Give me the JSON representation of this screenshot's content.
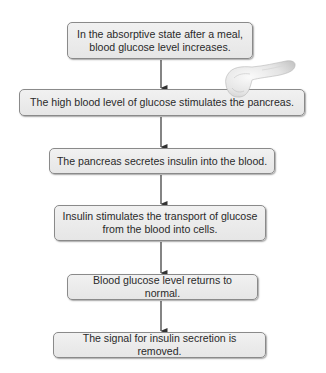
{
  "diagram": {
    "title": "",
    "type": "flowchart",
    "direction": "top-to-bottom",
    "steps": [
      {
        "id": "step-1",
        "lines": [
          "In the absorptive state after a meal,",
          "blood glucose level increases."
        ]
      },
      {
        "id": "step-2",
        "lines": [
          "The high blood level of glucose stimulates the pancreas."
        ]
      },
      {
        "id": "step-3",
        "lines": [
          "The pancreas secretes insulin into the blood."
        ]
      },
      {
        "id": "step-4",
        "lines": [
          "Insulin stimulates the transport of glucose",
          "from the blood into cells."
        ]
      },
      {
        "id": "step-5",
        "lines": [
          "Blood glucose level returns to normal."
        ]
      },
      {
        "id": "step-6",
        "lines": [
          "The signal for insulin secretion is removed."
        ]
      }
    ],
    "connections": [
      {
        "from": "step-1",
        "to": "step-2"
      },
      {
        "from": "step-2",
        "to": "step-3"
      },
      {
        "from": "step-3",
        "to": "step-4"
      },
      {
        "from": "step-4",
        "to": "step-5"
      },
      {
        "from": "step-5",
        "to": "step-6"
      }
    ],
    "illustrations": [
      {
        "name": "pancreas-icon",
        "description": "pancreas organ illustration",
        "attached_to": "step-2"
      }
    ],
    "colors": {
      "box_fill": "#ebebeb",
      "box_border": "#8a8a8a",
      "text": "#2a2a2a",
      "arrow": "#333333",
      "background": "#ffffff"
    }
  }
}
